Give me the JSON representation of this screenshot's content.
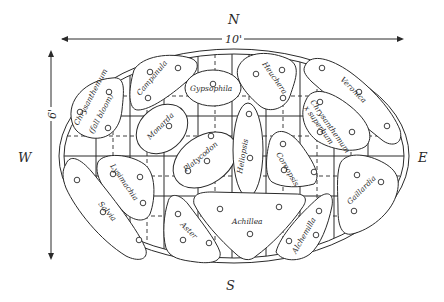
{
  "compass": {
    "north": "N",
    "south": "S",
    "east": "E",
    "west": "W"
  },
  "dimensions": {
    "length": "10'",
    "width": "6'"
  },
  "beds": [
    {
      "id": "chrysanthemum-fall",
      "label": "Chrysanthemum",
      "sublabel": "(fall bloom)"
    },
    {
      "id": "campanula",
      "label": "Campanula"
    },
    {
      "id": "gypsophila",
      "label": "Gypsophila"
    },
    {
      "id": "heuchera",
      "label": "Heuchera"
    },
    {
      "id": "veronica",
      "label": "Veronica"
    },
    {
      "id": "monarda",
      "label": "Monarda"
    },
    {
      "id": "platycodon",
      "label": "Platycodon"
    },
    {
      "id": "heliopsis",
      "label": "Heliopsis"
    },
    {
      "id": "chrysanthemum-superbum",
      "label": "Chrysanthemum",
      "sublabel": "x superbum"
    },
    {
      "id": "coreopsis",
      "label": "Coreopsis"
    },
    {
      "id": "lysimachia",
      "label": "Lysimachia"
    },
    {
      "id": "salvia",
      "label": "Salvia"
    },
    {
      "id": "aster",
      "label": "Aster"
    },
    {
      "id": "achillea",
      "label": "Achillea"
    },
    {
      "id": "alchemilla",
      "label": "Alchemilla"
    },
    {
      "id": "gaillardia",
      "label": "Gaillardia"
    }
  ]
}
